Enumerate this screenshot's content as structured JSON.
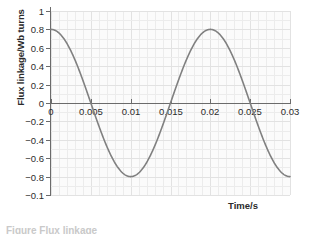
{
  "chart_data": {
    "type": "line",
    "title": "",
    "xlabel": "Time/s",
    "ylabel": "Flux linkage/Wb turns",
    "xlim": [
      0,
      0.03
    ],
    "ylim": [
      -1,
      1
    ],
    "grid": true,
    "legend": null,
    "xticks": [
      0,
      0.005,
      0.01,
      0.015,
      0.02,
      0.025,
      0.03
    ],
    "xticklabels": [
      "0",
      "0.005",
      "0.01",
      "0.015",
      "0.02",
      "0.025",
      "0.03"
    ],
    "yticks": [
      1,
      0.8,
      0.6,
      0.4,
      0.2,
      0,
      -0.2,
      -0.4,
      -0.6,
      -0.8,
      -1
    ],
    "yticklabels": [
      "1",
      "0.8",
      "0.6",
      "0.4",
      "0.2",
      "0",
      "−0.2",
      "−0.4",
      "−0.6",
      "−0.8",
      "−0.1"
    ],
    "series": [
      {
        "name": "Flux linkage",
        "color": "#808080",
        "equation": "0.8 * cos(2*pi*t/0.02)",
        "amplitude": 0.8,
        "period": 0.02,
        "x": [
          0,
          0.001,
          0.002,
          0.003,
          0.004,
          0.005,
          0.006,
          0.007,
          0.008,
          0.009,
          0.01,
          0.011,
          0.012,
          0.013,
          0.014,
          0.015,
          0.016,
          0.017,
          0.018,
          0.019,
          0.02,
          0.021,
          0.022,
          0.023,
          0.024,
          0.025,
          0.026,
          0.027,
          0.028,
          0.029,
          0.03
        ],
        "values": [
          0.8,
          0.753,
          0.618,
          0.408,
          0.147,
          -0.147,
          -0.408,
          -0.618,
          -0.753,
          -0.8,
          -0.753,
          -0.618,
          -0.408,
          -0.147,
          0.147,
          0.408,
          0.618,
          0.753,
          0.8,
          0.753,
          0.8,
          0.753,
          0.618,
          0.408,
          0.147,
          -0.147,
          -0.408,
          -0.618,
          -0.753,
          -0.8,
          -0.8
        ]
      }
    ],
    "annotations": [
      {
        "name": "zero-crossing",
        "x": 0.005,
        "y": 0
      },
      {
        "name": "minimum",
        "x": 0.01,
        "y": -0.8
      },
      {
        "name": "zero-crossing",
        "x": 0.015,
        "y": 0
      },
      {
        "name": "maximum",
        "x": 0.02,
        "y": 0.8
      },
      {
        "name": "zero-crossing",
        "x": 0.025,
        "y": 0
      }
    ]
  },
  "caption": {
    "text": "Figure  Flux linkage"
  }
}
